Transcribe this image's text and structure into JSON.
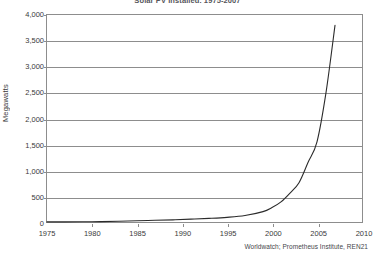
{
  "chart_data": {
    "type": "line",
    "title": "Solar PV Installed, 1975-2007",
    "xlabel": "",
    "ylabel": "Megawatts",
    "xlim": [
      1975,
      2010
    ],
    "ylim": [
      0,
      4000
    ],
    "grid": true,
    "legend": null,
    "x_ticks": [
      "1975",
      "1980",
      "1985",
      "1990",
      "1995",
      "2000",
      "2005",
      "2010"
    ],
    "x_tick_values": [
      1975,
      1980,
      1985,
      1990,
      1995,
      2000,
      2005,
      2010
    ],
    "y_ticks": [
      "0",
      "500",
      "1,000",
      "1,500",
      "2,000",
      "2,500",
      "3,000",
      "3,500",
      "4,000"
    ],
    "y_tick_values": [
      0,
      500,
      1000,
      1500,
      2000,
      2500,
      3000,
      3500,
      4000
    ],
    "series": [
      {
        "name": "Solar PV installed capacity",
        "x": [
          1975,
          1977,
          1979,
          1981,
          1983,
          1985,
          1987,
          1989,
          1991,
          1993,
          1995,
          1997,
          1999,
          2000,
          2001,
          2002,
          2003,
          2004,
          2005,
          2006,
          2007
        ],
        "values": [
          2,
          3,
          5,
          8,
          15,
          25,
          33,
          42,
          55,
          70,
          90,
          125,
          200,
          280,
          390,
          560,
          760,
          1150,
          1550,
          2500,
          3800
        ]
      }
    ],
    "annotations": [],
    "source": "Worldwatch; Prometheus Institute, REN21"
  },
  "colors": {
    "axis": "#8d8d8d",
    "gridline": "#8d8d8d",
    "curve": "#2b2b2b",
    "text": "#3a3a3a",
    "background": "#ffffff"
  }
}
